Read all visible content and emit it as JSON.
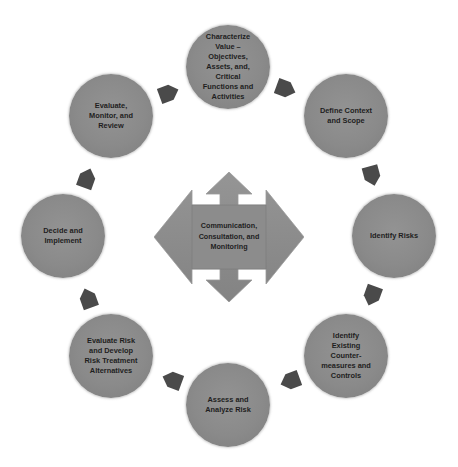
{
  "diagram": {
    "type": "cycle",
    "colors": {
      "node_fill": "#8a8a8a",
      "arrow_fill": "#4a4a4a",
      "center_fill": "#8c8c8c",
      "text": "#1e1e1e",
      "background": "#ffffff"
    },
    "center": {
      "label": "Communication,\nConsultation, and\nMonitoring",
      "shape": "four-way-arrow"
    },
    "nodes": [
      {
        "label": "Characterize\nValue –\nObjectives,\nAssets, and,\nCritical\nFunctions and\nActivities"
      },
      {
        "label": "Define Context\nand Scope"
      },
      {
        "label": "Identify Risks"
      },
      {
        "label": "Identify\nExisting\nCounter-\nmeasures and\nControls"
      },
      {
        "label": "Assess and\nAnalyze Risk"
      },
      {
        "label": "Evaluate Risk\nand Develop\nRisk Treatment\nAlternatives"
      },
      {
        "label": "Decide and\nImplement"
      },
      {
        "label": "Evaluate,\nMonitor, and\nReview"
      }
    ],
    "arrows": [
      {
        "icon": "arrow-right-down-icon",
        "from": 0,
        "to": 1
      },
      {
        "icon": "arrow-down-icon",
        "from": 1,
        "to": 2
      },
      {
        "icon": "arrow-down-left-icon",
        "from": 2,
        "to": 3
      },
      {
        "icon": "arrow-left-icon",
        "from": 3,
        "to": 4
      },
      {
        "icon": "arrow-left-up-icon",
        "from": 4,
        "to": 5
      },
      {
        "icon": "arrow-up-icon",
        "from": 5,
        "to": 6
      },
      {
        "icon": "arrow-up-right-icon",
        "from": 6,
        "to": 7
      },
      {
        "icon": "arrow-right-icon",
        "from": 7,
        "to": 0
      }
    ]
  }
}
